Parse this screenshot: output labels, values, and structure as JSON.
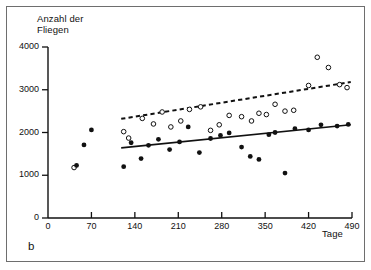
{
  "figure": {
    "panel_letter": "b",
    "background": "#ffffff",
    "frame_color": "#6e6e6e"
  },
  "chart_data": {
    "type": "scatter",
    "title": "",
    "ylabel": "Anzahl der\nFliegen",
    "xlabel": "Tage",
    "xlim": [
      0,
      490
    ],
    "ylim": [
      0,
      4000
    ],
    "xticks": [
      0,
      70,
      140,
      210,
      280,
      350,
      420,
      490
    ],
    "xticklabels": [
      "0",
      "70",
      "140",
      "210",
      "280",
      "350",
      "420",
      "490"
    ],
    "yticks": [
      0,
      1000,
      2000,
      3000,
      4000
    ],
    "yticklabels": [
      "0",
      "1000",
      "2000",
      "3000",
      "4000"
    ],
    "grid": false,
    "legend": null,
    "series": [
      {
        "name": "offene Kreise",
        "marker": "open-circle",
        "color": "#111111",
        "points": [
          [
            42,
            1180
          ],
          [
            122,
            2020
          ],
          [
            130,
            1870
          ],
          [
            152,
            2330
          ],
          [
            170,
            2200
          ],
          [
            184,
            2480
          ],
          [
            198,
            2130
          ],
          [
            214,
            2270
          ],
          [
            228,
            2540
          ],
          [
            246,
            2600
          ],
          [
            262,
            2050
          ],
          [
            276,
            2180
          ],
          [
            292,
            2400
          ],
          [
            312,
            2370
          ],
          [
            328,
            2270
          ],
          [
            340,
            2450
          ],
          [
            352,
            2420
          ],
          [
            366,
            2660
          ],
          [
            382,
            2500
          ],
          [
            396,
            2520
          ],
          [
            420,
            3100
          ],
          [
            434,
            3760
          ],
          [
            452,
            3520
          ],
          [
            470,
            3120
          ],
          [
            482,
            3050
          ]
        ]
      },
      {
        "name": "gefuellte Kreise",
        "marker": "filled-circle",
        "color": "#111111",
        "points": [
          [
            46,
            1230
          ],
          [
            58,
            1710
          ],
          [
            70,
            2060
          ],
          [
            122,
            1200
          ],
          [
            134,
            1760
          ],
          [
            150,
            1390
          ],
          [
            162,
            1700
          ],
          [
            178,
            1840
          ],
          [
            196,
            1600
          ],
          [
            212,
            1780
          ],
          [
            226,
            2130
          ],
          [
            244,
            1530
          ],
          [
            262,
            1860
          ],
          [
            278,
            1930
          ],
          [
            292,
            1990
          ],
          [
            312,
            1660
          ],
          [
            326,
            1440
          ],
          [
            340,
            1370
          ],
          [
            356,
            1950
          ],
          [
            366,
            2000
          ],
          [
            382,
            1050
          ],
          [
            398,
            2090
          ],
          [
            420,
            2060
          ],
          [
            440,
            2180
          ],
          [
            466,
            2150
          ],
          [
            484,
            2190
          ]
        ]
      }
    ],
    "trendlines": [
      {
        "name": "obere Regressionsgerade",
        "style": "dashed",
        "color": "#111111",
        "x": [
          118,
          488
        ],
        "y": [
          2320,
          3180
        ]
      },
      {
        "name": "untere Regressionsgerade",
        "style": "solid",
        "color": "#111111",
        "x": [
          118,
          488
        ],
        "y": [
          1640,
          2180
        ]
      }
    ]
  }
}
